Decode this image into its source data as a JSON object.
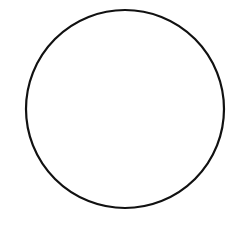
{
  "canvas": {
    "width": 249,
    "height": 238,
    "background": "#ffffff"
  },
  "shapes": [
    {
      "type": "circle",
      "cx": 125,
      "cy": 109,
      "r": 99,
      "stroke": "#111111",
      "stroke_width": 2.2,
      "fill": "none"
    }
  ]
}
